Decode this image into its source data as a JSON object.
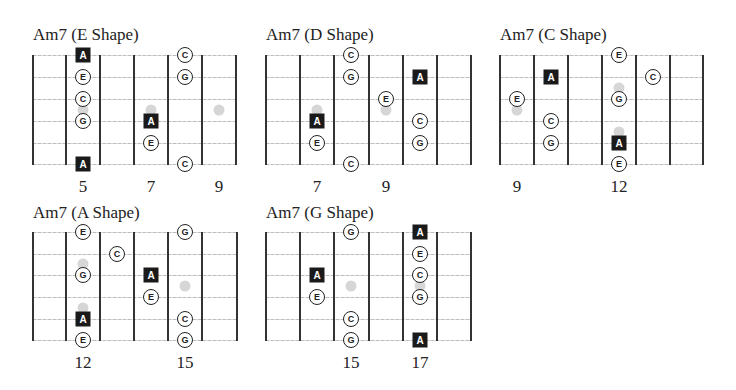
{
  "colors": {
    "fret": "#333333",
    "string": "#c4c4c4",
    "inlay": "#d6d6d6",
    "root_fill": "#1a1a1a",
    "note_border": "#222222"
  },
  "diagrams": [
    {
      "title": "Am7 (E Shape)",
      "title_pos": [
        33,
        26
      ],
      "frets_x": [
        33,
        66,
        100,
        134,
        168,
        202,
        236
      ],
      "strings_y": [
        55,
        77,
        99,
        121,
        143,
        164
      ],
      "fret_labels": [
        {
          "text": "5",
          "x": 83
        },
        {
          "text": "7",
          "x": 151
        },
        {
          "text": "9",
          "x": 219
        }
      ],
      "label_y": 178,
      "inlays": [
        [
          83,
          110
        ],
        [
          151,
          110
        ],
        [
          219,
          110
        ]
      ],
      "notes": [
        {
          "n": "A",
          "root": true,
          "x": 83,
          "y": 55
        },
        {
          "n": "E",
          "root": false,
          "x": 83,
          "y": 77
        },
        {
          "n": "C",
          "root": false,
          "x": 83,
          "y": 99
        },
        {
          "n": "G",
          "root": false,
          "x": 83,
          "y": 121
        },
        {
          "n": "A",
          "root": true,
          "x": 83,
          "y": 164
        },
        {
          "n": "A",
          "root": true,
          "x": 151,
          "y": 121
        },
        {
          "n": "E",
          "root": false,
          "x": 151,
          "y": 143
        },
        {
          "n": "C",
          "root": false,
          "x": 185,
          "y": 55
        },
        {
          "n": "G",
          "root": false,
          "x": 185,
          "y": 77
        },
        {
          "n": "C",
          "root": false,
          "x": 185,
          "y": 164
        }
      ]
    },
    {
      "title": "Am7 (D Shape)",
      "title_pos": [
        266,
        26
      ],
      "frets_x": [
        266,
        300,
        334,
        369,
        403,
        437,
        471
      ],
      "strings_y": [
        55,
        77,
        99,
        121,
        143,
        164
      ],
      "fret_labels": [
        {
          "text": "7",
          "x": 317
        },
        {
          "text": "9",
          "x": 386
        }
      ],
      "label_y": 178,
      "inlays": [
        [
          317,
          110
        ],
        [
          386,
          110
        ]
      ],
      "notes": [
        {
          "n": "C",
          "root": false,
          "x": 351,
          "y": 55
        },
        {
          "n": "G",
          "root": false,
          "x": 351,
          "y": 77
        },
        {
          "n": "C",
          "root": false,
          "x": 351,
          "y": 164
        },
        {
          "n": "A",
          "root": true,
          "x": 317,
          "y": 121
        },
        {
          "n": "E",
          "root": false,
          "x": 317,
          "y": 143
        },
        {
          "n": "E",
          "root": false,
          "x": 386,
          "y": 99
        },
        {
          "n": "A",
          "root": true,
          "x": 420,
          "y": 77
        },
        {
          "n": "C",
          "root": false,
          "x": 420,
          "y": 121
        },
        {
          "n": "G",
          "root": false,
          "x": 420,
          "y": 143
        }
      ]
    },
    {
      "title": "Am7 (C Shape)",
      "title_pos": [
        500,
        26
      ],
      "frets_x": [
        500,
        534,
        568,
        602,
        636,
        670,
        703
      ],
      "strings_y": [
        55,
        77,
        99,
        121,
        143,
        164
      ],
      "fret_labels": [
        {
          "text": "9",
          "x": 517
        },
        {
          "text": "12",
          "x": 619
        }
      ],
      "label_y": 178,
      "inlays": [
        [
          517,
          110
        ],
        [
          619,
          88
        ],
        [
          619,
          132
        ]
      ],
      "notes": [
        {
          "n": "E",
          "root": false,
          "x": 517,
          "y": 99
        },
        {
          "n": "A",
          "root": true,
          "x": 551,
          "y": 77
        },
        {
          "n": "C",
          "root": false,
          "x": 551,
          "y": 121
        },
        {
          "n": "G",
          "root": false,
          "x": 551,
          "y": 143
        },
        {
          "n": "E",
          "root": false,
          "x": 619,
          "y": 55
        },
        {
          "n": "G",
          "root": false,
          "x": 619,
          "y": 99
        },
        {
          "n": "A",
          "root": true,
          "x": 619,
          "y": 143
        },
        {
          "n": "E",
          "root": false,
          "x": 619,
          "y": 164
        },
        {
          "n": "C",
          "root": false,
          "x": 653,
          "y": 77
        }
      ]
    },
    {
      "title": "Am7 (A Shape)",
      "title_pos": [
        33,
        204
      ],
      "frets_x": [
        33,
        66,
        100,
        134,
        168,
        202,
        237
      ],
      "strings_y": [
        232,
        254,
        275,
        297,
        319,
        340
      ],
      "fret_labels": [
        {
          "text": "12",
          "x": 83
        },
        {
          "text": "15",
          "x": 185
        }
      ],
      "label_y": 354,
      "inlays": [
        [
          83,
          264
        ],
        [
          83,
          308
        ],
        [
          185,
          286
        ]
      ],
      "notes": [
        {
          "n": "E",
          "root": false,
          "x": 83,
          "y": 232
        },
        {
          "n": "G",
          "root": false,
          "x": 83,
          "y": 275
        },
        {
          "n": "A",
          "root": true,
          "x": 83,
          "y": 319
        },
        {
          "n": "E",
          "root": false,
          "x": 83,
          "y": 340
        },
        {
          "n": "C",
          "root": false,
          "x": 117,
          "y": 254
        },
        {
          "n": "A",
          "root": true,
          "x": 151,
          "y": 275
        },
        {
          "n": "E",
          "root": false,
          "x": 151,
          "y": 297
        },
        {
          "n": "G",
          "root": false,
          "x": 185,
          "y": 232
        },
        {
          "n": "C",
          "root": false,
          "x": 185,
          "y": 319
        },
        {
          "n": "G",
          "root": false,
          "x": 185,
          "y": 340
        }
      ]
    },
    {
      "title": "Am7 (G Shape)",
      "title_pos": [
        266,
        204
      ],
      "frets_x": [
        266,
        300,
        334,
        369,
        403,
        437,
        471
      ],
      "strings_y": [
        232,
        254,
        275,
        297,
        319,
        340
      ],
      "fret_labels": [
        {
          "text": "15",
          "x": 351
        },
        {
          "text": "17",
          "x": 420
        }
      ],
      "label_y": 354,
      "inlays": [
        [
          351,
          286
        ],
        [
          420,
          286
        ]
      ],
      "notes": [
        {
          "n": "A",
          "root": true,
          "x": 317,
          "y": 275
        },
        {
          "n": "E",
          "root": false,
          "x": 317,
          "y": 297
        },
        {
          "n": "G",
          "root": false,
          "x": 351,
          "y": 232
        },
        {
          "n": "C",
          "root": false,
          "x": 351,
          "y": 319
        },
        {
          "n": "G",
          "root": false,
          "x": 351,
          "y": 340
        },
        {
          "n": "A",
          "root": true,
          "x": 420,
          "y": 232
        },
        {
          "n": "E",
          "root": false,
          "x": 420,
          "y": 254
        },
        {
          "n": "C",
          "root": false,
          "x": 420,
          "y": 275
        },
        {
          "n": "G",
          "root": false,
          "x": 420,
          "y": 297
        },
        {
          "n": "A",
          "root": true,
          "x": 420,
          "y": 340
        }
      ]
    }
  ]
}
